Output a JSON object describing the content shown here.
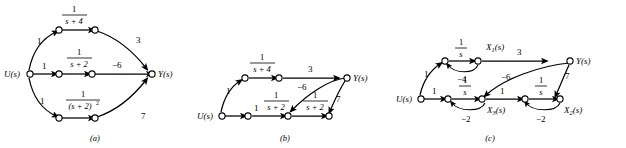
{
  "figure": {
    "background": "#ffffff",
    "ink": "#000000"
  },
  "panels": [
    {
      "id": "a",
      "caption": "(a)",
      "input_label": "U(s)",
      "output_label": "Y(s)",
      "branches": [
        {
          "path": "top",
          "input_gain": "1",
          "transfer_numerator": "1",
          "transfer_denominator": "s + 4",
          "output_gain": "3"
        },
        {
          "path": "middle",
          "input_gain": "1",
          "transfer_numerator": "1",
          "transfer_denominator": "s + 2",
          "output_gain": "−6"
        },
        {
          "path": "bottom",
          "input_gain": "1",
          "transfer_numerator": "1",
          "transfer_denominator": "(s + 2)",
          "transfer_denominator_exponent": "2",
          "output_gain": "7"
        }
      ]
    },
    {
      "id": "b",
      "caption": "(b)",
      "input_label": "U(s)",
      "output_label": "Y(s)",
      "branches": [
        {
          "path": "top",
          "input_gain": "1",
          "transfer_numerator": "1",
          "transfer_denominator": "s + 4",
          "output_gain": "3"
        },
        {
          "path": "bottom-first",
          "input_gain": "1",
          "transfer_numerator": "1",
          "transfer_denominator": "s + 2",
          "output_gain": "−6"
        },
        {
          "path": "bottom-second",
          "transfer_numerator": "1",
          "transfer_denominator": "s + 2",
          "output_gain": "7"
        }
      ]
    },
    {
      "id": "c",
      "caption": "(c)",
      "input_label": "U(s)",
      "output_label": "Y(s)",
      "state_labels": [
        "X_1(s)",
        "X_3(s)",
        "X_2(s)"
      ],
      "state_label_1_base": "X",
      "state_label_1_sub": "1",
      "state_label_1_tail": "(s)",
      "state_label_2_base": "X",
      "state_label_2_sub": "2",
      "state_label_2_tail": "(s)",
      "state_label_3_base": "X",
      "state_label_3_sub": "3",
      "state_label_3_tail": "(s)",
      "integrator_numerator": "1",
      "integrator_denominator": "s",
      "gains": {
        "u_to_top": "1",
        "u_to_bottom": "1",
        "x1_to_y": "3",
        "x1_self_loop": "−4",
        "x3_to_y": "−6",
        "x3_self_loop": "−2",
        "x3_to_x2_path": "1",
        "x2_self_loop": "−2",
        "x2_to_y": "7"
      }
    }
  ]
}
